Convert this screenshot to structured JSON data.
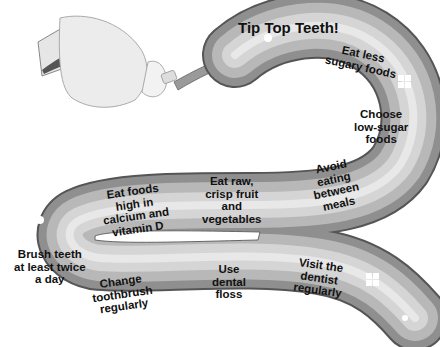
{
  "title": "Tip Top Teeth!",
  "tips": [
    {
      "id": "eat-less-sugary",
      "text": "Eat less sugary foods",
      "lines": [
        "Eat less",
        "sugary foods"
      ]
    },
    {
      "id": "choose-low-sugar",
      "text": "Choose low-sugar foods",
      "lines": [
        "Choose",
        "low-sugar",
        "foods"
      ]
    },
    {
      "id": "avoid-eating-between-meals",
      "text": "Avoid eating between meals",
      "lines": [
        "Avoid",
        "eating",
        "between",
        "meals"
      ]
    },
    {
      "id": "eat-raw-crisp",
      "text": "Eat raw, crisp fruit and vegetables",
      "lines": [
        "Eat raw,",
        "crisp fruit",
        "and",
        "vegetables"
      ]
    },
    {
      "id": "eat-calcium",
      "text": "Eat foods high in calcium and vitamin D",
      "lines": [
        "Eat foods",
        "high in",
        "calcium and",
        "vitamin D"
      ]
    },
    {
      "id": "brush-twice",
      "text": "Brush teeth at least twice a day",
      "lines": [
        "Brush teeth",
        "at least twice",
        "a day"
      ]
    },
    {
      "id": "change-toothbrush",
      "text": "Change toothbrush regularly",
      "lines": [
        "Change",
        "toothbrush",
        "regularly"
      ]
    },
    {
      "id": "use-floss",
      "text": "Use dental floss",
      "lines": [
        "Use",
        "dental",
        "floss"
      ]
    },
    {
      "id": "visit-dentist",
      "text": "Visit the dentist regularly",
      "lines": [
        "Visit the",
        "dentist",
        "regularly"
      ]
    }
  ],
  "colors": {
    "ribbon_outer": "#8a8a8a",
    "ribbon_mid": "#b9b9b9",
    "ribbon_light": "#d6d6d6",
    "ribbon_highlight": "#ececec",
    "outline": "#555555",
    "text": "#111111"
  }
}
